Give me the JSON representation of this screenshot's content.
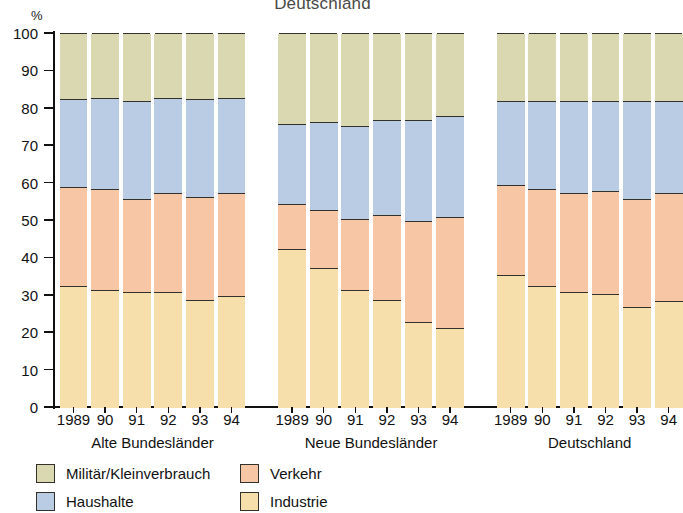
{
  "chart_data": {
    "type": "bar",
    "subtype": "stacked-percentage",
    "title": "Deutschland",
    "ylabel": "%",
    "xlabel": "",
    "ylim": [
      0,
      100
    ],
    "ytick_values": [
      0,
      10,
      20,
      30,
      40,
      50,
      60,
      70,
      80,
      90,
      100
    ],
    "ytick_labels": [
      "0",
      "10",
      "20",
      "30",
      "40",
      "50",
      "60",
      "70",
      "80",
      "90",
      "100"
    ],
    "grid": false,
    "legend_position": "bottom-left",
    "series": [
      {
        "name": "Industrie",
        "color": "#f6dfab",
        "values": [
          32.5,
          31.5,
          31.0,
          31.0,
          29.0,
          30.0,
          42.5,
          37.5,
          31.5,
          29.0,
          23.0,
          21.5,
          35.5,
          32.5,
          31.0,
          30.5,
          27.0,
          28.5
        ]
      },
      {
        "name": "Verkehr",
        "color": "#f6c6a5",
        "values": [
          26.5,
          27.0,
          25.0,
          26.5,
          27.5,
          27.5,
          12.0,
          15.5,
          19.0,
          22.5,
          27.0,
          29.5,
          24.0,
          26.0,
          26.5,
          27.5,
          29.0,
          29.0
        ]
      },
      {
        "name": "Haushalte",
        "color": "#bacce3",
        "values": [
          23.5,
          24.5,
          26.0,
          25.5,
          26.0,
          25.5,
          21.5,
          23.5,
          25.0,
          25.5,
          27.0,
          27.0,
          22.5,
          23.5,
          24.5,
          24.0,
          26.0,
          24.5
        ]
      },
      {
        "name": "Militär/Kleinverbrauch",
        "color": "#d9d8b1",
        "values": [
          17.5,
          17.0,
          18.0,
          17.0,
          17.5,
          17.0,
          24.0,
          23.5,
          24.5,
          23.0,
          23.0,
          22.0,
          18.0,
          18.0,
          18.0,
          18.0,
          18.0,
          18.0
        ]
      }
    ],
    "groups": [
      {
        "label": "Alte Bundesländer",
        "categories": [
          "1989",
          "90",
          "91",
          "92",
          "93",
          "94"
        ]
      },
      {
        "label": "Neue Bundesländer",
        "categories": [
          "1989",
          "90",
          "91",
          "92",
          "93",
          "94"
        ]
      },
      {
        "label": "Deutschland",
        "categories": [
          "1989",
          "90",
          "91",
          "92",
          "93",
          "94"
        ]
      }
    ],
    "legend": [
      {
        "label": "Militär/Kleinverbrauch",
        "color": "#d9d8b1"
      },
      {
        "label": "Haushalte",
        "color": "#bacce3"
      },
      {
        "label": "Verkehr",
        "color": "#f6c6a5"
      },
      {
        "label": "Industrie",
        "color": "#f6dfab"
      }
    ]
  }
}
